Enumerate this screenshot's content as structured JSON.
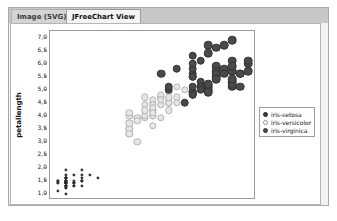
{
  "window": {
    "tabs": [
      {
        "label": "Image (SVG)",
        "active": false,
        "name": "tab-image-svg"
      },
      {
        "label": "JFreeChart View",
        "active": true,
        "name": "tab-jfreechart-view"
      }
    ]
  },
  "colors": {
    "setosa": "#3a3a3a",
    "versicolor": "#e6e6e6",
    "virginica": "#4a4a4a",
    "plot_background": "#ffffff",
    "panel_background": "#f2f2f2",
    "tab_strip": "#c8c8c8",
    "axis": "#9a9a9a"
  },
  "chart_data": {
    "type": "scatter",
    "title": "",
    "xlabel": "petalwidth",
    "ylabel": "petallength",
    "xlim": [
      0.0,
      2.6
    ],
    "ylim": [
      0.75,
      7.25
    ],
    "xticks": [
      "0,00",
      "0,25",
      "0,50",
      "0,75",
      "1,00",
      "1,25",
      "1,50",
      "1,75",
      "2,00",
      "2,25",
      "2,50"
    ],
    "xtick_values": [
      0.0,
      0.25,
      0.5,
      0.75,
      1.0,
      1.25,
      1.5,
      1.75,
      2.0,
      2.25,
      2.5
    ],
    "yticks": [
      "1,0",
      "1,5",
      "2,0",
      "2,5",
      "3,0",
      "3,5",
      "4,0",
      "4,5",
      "5,0",
      "5,5",
      "6,0",
      "6,5",
      "7,0"
    ],
    "ytick_values": [
      1.0,
      1.5,
      2.0,
      2.5,
      3.0,
      3.5,
      4.0,
      4.5,
      5.0,
      5.5,
      6.0,
      6.5,
      7.0
    ],
    "grid": false,
    "legend_position": "right-outside",
    "series": [
      {
        "name": "iris-setosa",
        "marker": "filled-circle-small",
        "color": "#3a3a3a",
        "points": [
          [
            0.2,
            1.4
          ],
          [
            0.2,
            1.4
          ],
          [
            0.2,
            1.3
          ],
          [
            0.2,
            1.5
          ],
          [
            0.2,
            1.4
          ],
          [
            0.4,
            1.7
          ],
          [
            0.3,
            1.4
          ],
          [
            0.2,
            1.5
          ],
          [
            0.2,
            1.4
          ],
          [
            0.1,
            1.5
          ],
          [
            0.2,
            1.5
          ],
          [
            0.2,
            1.6
          ],
          [
            0.1,
            1.4
          ],
          [
            0.1,
            1.1
          ],
          [
            0.2,
            1.2
          ],
          [
            0.4,
            1.5
          ],
          [
            0.4,
            1.3
          ],
          [
            0.3,
            1.4
          ],
          [
            0.3,
            1.7
          ],
          [
            0.3,
            1.5
          ],
          [
            0.2,
            1.7
          ],
          [
            0.4,
            1.5
          ],
          [
            0.2,
            1.0
          ],
          [
            0.5,
            1.7
          ],
          [
            0.2,
            1.9
          ],
          [
            0.2,
            1.6
          ],
          [
            0.4,
            1.6
          ],
          [
            0.2,
            1.5
          ],
          [
            0.2,
            1.4
          ],
          [
            0.2,
            1.6
          ],
          [
            0.2,
            1.6
          ],
          [
            0.4,
            1.5
          ],
          [
            0.1,
            1.5
          ],
          [
            0.2,
            1.4
          ],
          [
            0.2,
            1.5
          ],
          [
            0.2,
            1.2
          ],
          [
            0.2,
            1.3
          ],
          [
            0.1,
            1.4
          ],
          [
            0.2,
            1.3
          ],
          [
            0.2,
            1.5
          ],
          [
            0.3,
            1.3
          ],
          [
            0.3,
            1.3
          ],
          [
            0.2,
            1.3
          ],
          [
            0.6,
            1.6
          ],
          [
            0.4,
            1.9
          ],
          [
            0.3,
            1.4
          ],
          [
            0.2,
            1.6
          ],
          [
            0.2,
            1.4
          ],
          [
            0.2,
            1.5
          ],
          [
            0.2,
            1.4
          ]
        ]
      },
      {
        "name": "iris-versicolor",
        "marker": "open-circle",
        "color": "#e6e6e6",
        "points": [
          [
            1.4,
            4.7
          ],
          [
            1.5,
            4.5
          ],
          [
            1.5,
            4.9
          ],
          [
            1.3,
            4.0
          ],
          [
            1.5,
            4.6
          ],
          [
            1.3,
            4.5
          ],
          [
            1.6,
            4.7
          ],
          [
            1.0,
            3.3
          ],
          [
            1.3,
            4.6
          ],
          [
            1.4,
            3.9
          ],
          [
            1.0,
            3.5
          ],
          [
            1.5,
            4.2
          ],
          [
            1.0,
            4.0
          ],
          [
            1.4,
            4.7
          ],
          [
            1.3,
            3.6
          ],
          [
            1.4,
            4.4
          ],
          [
            1.5,
            4.5
          ],
          [
            1.0,
            4.1
          ],
          [
            1.5,
            4.5
          ],
          [
            1.1,
            3.9
          ],
          [
            1.8,
            4.8
          ],
          [
            1.3,
            4.0
          ],
          [
            1.5,
            4.9
          ],
          [
            1.2,
            4.7
          ],
          [
            1.3,
            4.3
          ],
          [
            1.4,
            4.4
          ],
          [
            1.4,
            4.8
          ],
          [
            1.7,
            5.0
          ],
          [
            1.5,
            4.5
          ],
          [
            1.0,
            3.5
          ],
          [
            1.1,
            3.8
          ],
          [
            1.0,
            3.7
          ],
          [
            1.2,
            3.9
          ],
          [
            1.6,
            5.1
          ],
          [
            1.5,
            4.5
          ],
          [
            1.6,
            4.5
          ],
          [
            1.5,
            4.7
          ],
          [
            1.3,
            4.4
          ],
          [
            1.3,
            4.1
          ],
          [
            1.3,
            4.0
          ],
          [
            1.2,
            4.4
          ],
          [
            1.4,
            4.6
          ],
          [
            1.2,
            4.0
          ],
          [
            1.0,
            3.3
          ],
          [
            1.3,
            4.2
          ],
          [
            1.2,
            4.2
          ],
          [
            1.3,
            4.2
          ],
          [
            1.3,
            4.3
          ],
          [
            1.1,
            3.0
          ],
          [
            1.3,
            4.1
          ]
        ]
      },
      {
        "name": "iris-virginica",
        "marker": "filled-circle-large",
        "color": "#4a4a4a",
        "points": [
          [
            2.5,
            6.0
          ],
          [
            1.9,
            5.1
          ],
          [
            2.1,
            5.9
          ],
          [
            1.8,
            5.6
          ],
          [
            2.2,
            5.8
          ],
          [
            2.1,
            6.6
          ],
          [
            1.7,
            4.5
          ],
          [
            1.8,
            6.3
          ],
          [
            1.8,
            5.8
          ],
          [
            2.5,
            6.1
          ],
          [
            2.0,
            5.1
          ],
          [
            1.9,
            5.3
          ],
          [
            2.1,
            5.5
          ],
          [
            2.0,
            5.0
          ],
          [
            2.4,
            5.1
          ],
          [
            2.3,
            5.3
          ],
          [
            1.8,
            5.5
          ],
          [
            2.2,
            6.7
          ],
          [
            2.3,
            6.9
          ],
          [
            1.5,
            5.0
          ],
          [
            2.3,
            5.7
          ],
          [
            2.0,
            4.9
          ],
          [
            2.0,
            6.7
          ],
          [
            1.8,
            4.9
          ],
          [
            2.1,
            5.7
          ],
          [
            1.8,
            6.0
          ],
          [
            1.8,
            4.8
          ],
          [
            1.8,
            4.9
          ],
          [
            2.1,
            5.6
          ],
          [
            1.6,
            5.8
          ],
          [
            1.9,
            6.1
          ],
          [
            2.0,
            6.4
          ],
          [
            2.2,
            5.6
          ],
          [
            1.5,
            5.1
          ],
          [
            1.4,
            5.6
          ],
          [
            2.3,
            6.1
          ],
          [
            2.4,
            5.6
          ],
          [
            1.8,
            5.5
          ],
          [
            1.8,
            4.8
          ],
          [
            2.1,
            5.4
          ],
          [
            2.4,
            5.6
          ],
          [
            2.3,
            5.1
          ],
          [
            1.9,
            5.1
          ],
          [
            2.3,
            5.9
          ],
          [
            2.5,
            5.7
          ],
          [
            2.3,
            5.2
          ],
          [
            1.9,
            5.0
          ],
          [
            2.0,
            5.2
          ],
          [
            2.3,
            5.4
          ],
          [
            1.8,
            5.1
          ]
        ]
      }
    ]
  },
  "legend": {
    "items": [
      {
        "label": "iris-setosa",
        "swatch": "setosa"
      },
      {
        "label": "iris-versicolor",
        "swatch": "versicolor"
      },
      {
        "label": "iris-virginica",
        "swatch": "virginica"
      }
    ]
  }
}
